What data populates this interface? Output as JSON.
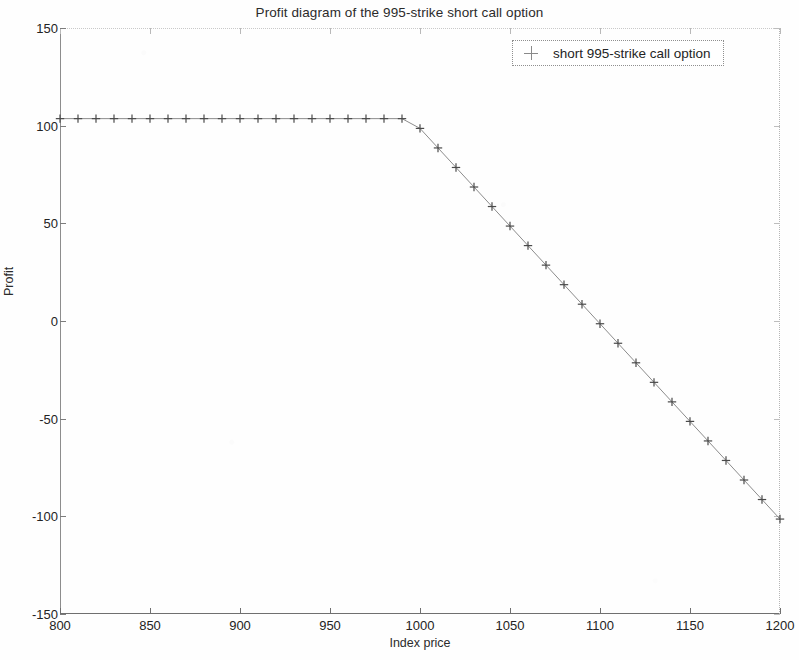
{
  "chart_data": {
    "type": "line",
    "title": "Profit diagram of the 995-strike short call option",
    "xlabel": "Index price",
    "ylabel": "Profit",
    "xlim": [
      800,
      1200
    ],
    "ylim": [
      -150,
      150
    ],
    "xticks": [
      800,
      850,
      900,
      950,
      1000,
      1050,
      1100,
      1150,
      1200
    ],
    "yticks": [
      150,
      100,
      50,
      0,
      -50,
      -100,
      -150
    ],
    "grid": false,
    "marker": "+",
    "marker_color": "#4a4a4a",
    "line_color": "#8c8c8c",
    "legend": {
      "position": "upper right",
      "entries": [
        {
          "name": "short 995-strike call option",
          "marker": "+"
        }
      ]
    },
    "annotations": {
      "strike": 995,
      "premium": 103.6,
      "breakeven": 1098.6
    },
    "series": [
      {
        "name": "short 995-strike call option",
        "x": [
          800,
          810,
          820,
          830,
          840,
          850,
          860,
          870,
          880,
          890,
          900,
          910,
          920,
          930,
          940,
          950,
          960,
          970,
          980,
          990,
          1000,
          1010,
          1020,
          1030,
          1040,
          1050,
          1060,
          1070,
          1080,
          1090,
          1100,
          1110,
          1120,
          1130,
          1140,
          1150,
          1160,
          1170,
          1180,
          1190,
          1200
        ],
        "values": [
          103.6,
          103.6,
          103.6,
          103.6,
          103.6,
          103.6,
          103.6,
          103.6,
          103.6,
          103.6,
          103.6,
          103.6,
          103.6,
          103.6,
          103.6,
          103.6,
          103.6,
          103.6,
          103.6,
          103.6,
          98.6,
          88.6,
          78.6,
          68.6,
          58.6,
          48.6,
          38.6,
          28.6,
          18.6,
          8.6,
          -1.4,
          -11.4,
          -21.4,
          -31.4,
          -41.4,
          -51.4,
          -61.4,
          -71.4,
          -81.4,
          -91.4,
          -101.4
        ]
      }
    ]
  },
  "axis_titles": {
    "x": "Index price",
    "y": "Profit"
  },
  "title_text": "Profit diagram of the 995-strike short call option",
  "legend_text": "short 995-strike call option"
}
